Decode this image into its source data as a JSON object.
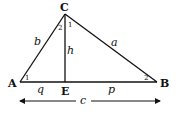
{
  "diagram": {
    "type": "right-triangle-altitude",
    "vertices": {
      "A": {
        "label": "A",
        "x": 20,
        "y": 82
      },
      "B": {
        "label": "B",
        "x": 157,
        "y": 82
      },
      "C": {
        "label": "C",
        "x": 65,
        "y": 14
      },
      "E": {
        "label": "E",
        "x": 65,
        "y": 82
      }
    },
    "sides": {
      "a": "a",
      "b": "b",
      "c": "c",
      "h": "h",
      "p": "p",
      "q": "q"
    },
    "angles": {
      "A1": "1",
      "B2": "2",
      "C1": "1",
      "C2": "2"
    },
    "colors": {
      "line": "#111111",
      "background": "#ffffff"
    }
  }
}
